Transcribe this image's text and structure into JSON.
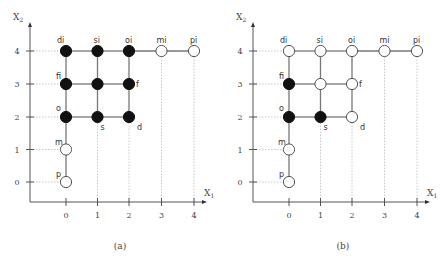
{
  "panels": [
    {
      "id": "a",
      "caption": "(a)",
      "offset_x": 0,
      "x_axis_label": "X",
      "x_axis_sub": "1",
      "y_axis_label": "X",
      "y_axis_sub": "2",
      "x_ticks": [
        "0",
        "1",
        "2",
        "3",
        "4"
      ],
      "y_ticks": [
        "0",
        "1",
        "2",
        "3",
        "4"
      ],
      "nodes": [
        {
          "label": "di",
          "x": 0,
          "y": 4,
          "filled": true
        },
        {
          "label": "si",
          "x": 1,
          "y": 4,
          "filled": true
        },
        {
          "label": "oi",
          "x": 2,
          "y": 4,
          "filled": true
        },
        {
          "label": "mi",
          "x": 3,
          "y": 4,
          "filled": false
        },
        {
          "label": "pi",
          "x": 4,
          "y": 4,
          "filled": false
        },
        {
          "label": "fi",
          "x": 0,
          "y": 3,
          "filled": true
        },
        {
          "label": "",
          "x": 1,
          "y": 3,
          "filled": true
        },
        {
          "label": "f",
          "x": 2,
          "y": 3,
          "filled": true
        },
        {
          "label": "o",
          "x": 0,
          "y": 2,
          "filled": true
        },
        {
          "label": "s",
          "x": 1,
          "y": 2,
          "filled": true
        },
        {
          "label": "d",
          "x": 2,
          "y": 2,
          "filled": true
        },
        {
          "label": "m",
          "x": 0,
          "y": 1,
          "filled": false
        },
        {
          "label": "p",
          "x": 0,
          "y": 0,
          "filled": false
        }
      ]
    },
    {
      "id": "b",
      "caption": "(b)",
      "offset_x": 223,
      "x_axis_label": "X",
      "x_axis_sub": "1",
      "y_axis_label": "X",
      "y_axis_sub": "2",
      "x_ticks": [
        "0",
        "1",
        "2",
        "3",
        "4"
      ],
      "y_ticks": [
        "0",
        "1",
        "2",
        "3",
        "4"
      ],
      "nodes": [
        {
          "label": "di",
          "x": 0,
          "y": 4,
          "filled": false
        },
        {
          "label": "si",
          "x": 1,
          "y": 4,
          "filled": false
        },
        {
          "label": "oi",
          "x": 2,
          "y": 4,
          "filled": false
        },
        {
          "label": "mi",
          "x": 3,
          "y": 4,
          "filled": false
        },
        {
          "label": "pi",
          "x": 4,
          "y": 4,
          "filled": false
        },
        {
          "label": "fi",
          "x": 0,
          "y": 3,
          "filled": true
        },
        {
          "label": "",
          "x": 1,
          "y": 3,
          "filled": false
        },
        {
          "label": "f",
          "x": 2,
          "y": 3,
          "filled": false
        },
        {
          "label": "o",
          "x": 0,
          "y": 2,
          "filled": true
        },
        {
          "label": "s",
          "x": 1,
          "y": 2,
          "filled": true
        },
        {
          "label": "d",
          "x": 2,
          "y": 2,
          "filled": false
        },
        {
          "label": "m",
          "x": 0,
          "y": 1,
          "filled": false
        },
        {
          "label": "p",
          "x": 0,
          "y": 0,
          "filled": false
        }
      ]
    }
  ],
  "edges": [
    [
      0,
      4,
      1,
      4
    ],
    [
      1,
      4,
      2,
      4
    ],
    [
      2,
      4,
      3,
      4
    ],
    [
      3,
      4,
      4,
      4
    ],
    [
      0,
      3,
      1,
      3
    ],
    [
      1,
      3,
      2,
      3
    ],
    [
      0,
      2,
      1,
      2
    ],
    [
      1,
      2,
      2,
      2
    ],
    [
      0,
      4,
      0,
      3
    ],
    [
      0,
      3,
      0,
      2
    ],
    [
      0,
      2,
      0,
      1
    ],
    [
      0,
      1,
      0,
      0
    ],
    [
      1,
      4,
      1,
      3
    ],
    [
      1,
      3,
      1,
      2
    ],
    [
      2,
      4,
      2,
      3
    ],
    [
      2,
      3,
      2,
      2
    ]
  ],
  "colors": {
    "filled": "#111111",
    "empty": "#ffffff",
    "stroke": "#555555"
  }
}
